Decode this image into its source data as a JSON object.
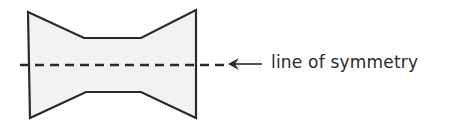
{
  "figure": {
    "shape": {
      "name": "symmetric-bowtie-polygon",
      "fill": "#f2f2f2",
      "stroke": "#2a2a2a",
      "points": "28,12 84,38 141,38 196,10 196,118 141,92 86,92 30,118"
    },
    "symmetry_line": {
      "y": 65,
      "x1": 20,
      "x2": 224,
      "dash": "9,6",
      "color": "#2a2a2a"
    },
    "arrow": {
      "direction": "left",
      "x_from": 262,
      "x_to": 228,
      "y": 64
    },
    "label": "line of symmetry"
  }
}
